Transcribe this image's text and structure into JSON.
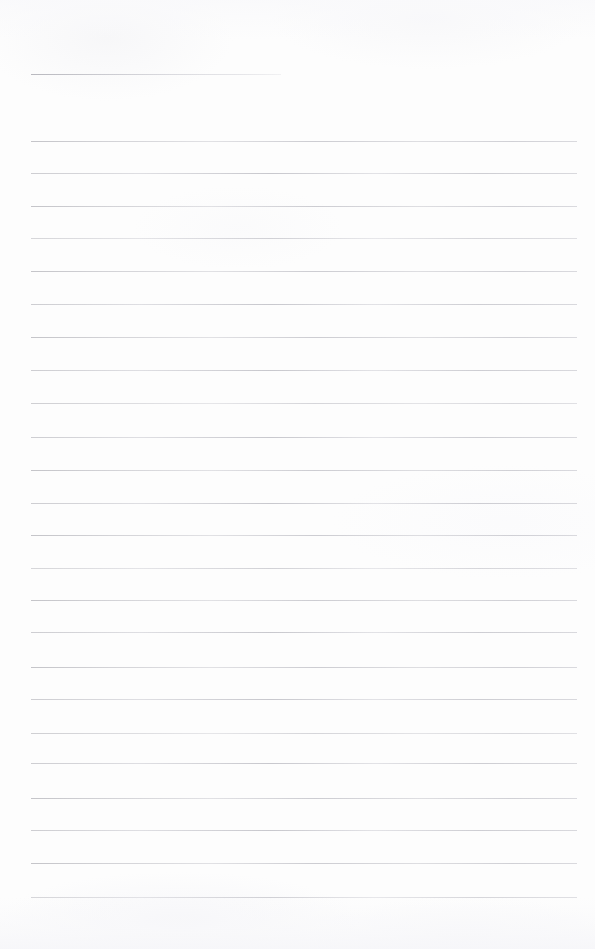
{
  "document": {
    "kind": "blank-lined-writing-paper",
    "page_width": 595,
    "page_height": 949,
    "background_color": "#fdfdfd",
    "rule_color": "#b4b4bc",
    "text_content": "",
    "title_line_text": "",
    "body_line_text": ""
  },
  "ruling": {
    "left_margin": 31,
    "right_margin": 577,
    "title_rule": {
      "y": 74,
      "x_start": 31,
      "x_end": 281
    },
    "line_spacing": 32.5,
    "first_body_line_y": 141,
    "last_body_line_y": 897,
    "body_line_count": 24,
    "body_line_ys": [
      141,
      173,
      206,
      238,
      271,
      304,
      337,
      370,
      403,
      437,
      470,
      503,
      535,
      568,
      600,
      632,
      667,
      699,
      733,
      763,
      798,
      830,
      863,
      897
    ]
  }
}
